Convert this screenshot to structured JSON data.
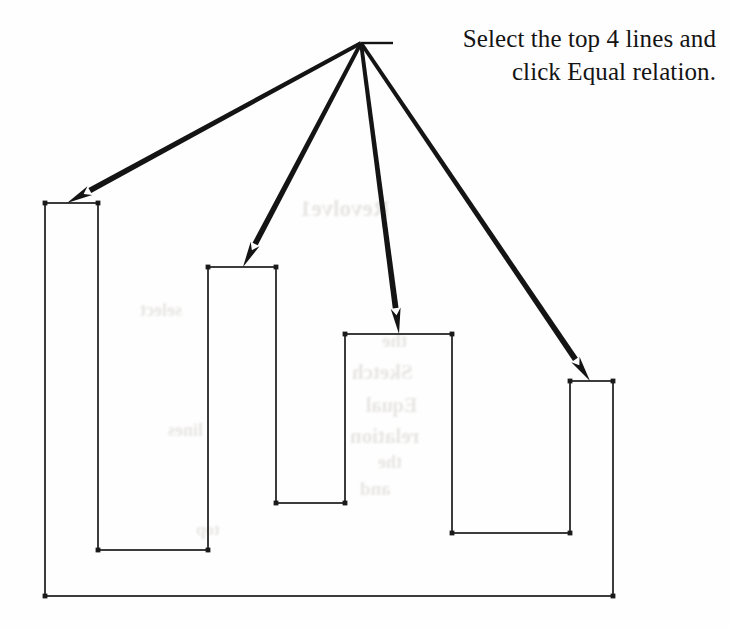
{
  "annotation": {
    "line1": "Select the top 4 lines and",
    "line2": "click Equal relation.",
    "arrow_count": 4,
    "leader_origin": {
      "x": 361,
      "y": 43
    },
    "leader_tail_x": 393,
    "ink_color": "#141414"
  },
  "sketch": {
    "name": "castellated-profile",
    "stroke_color": "#3c3c3c",
    "stroke_width": 2.0,
    "endpoint_color": "#1a1a1a",
    "baseline_y": 596,
    "left_x": 45,
    "right_x": 613,
    "towers": [
      {
        "id": "tower-1",
        "left": 45,
        "right": 98,
        "top": 203,
        "arrow_tip_x": 67,
        "arrow_tip_y": 203
      },
      {
        "id": "tower-2",
        "left": 208,
        "right": 276,
        "top": 267,
        "arrow_tip_x": 243,
        "arrow_tip_y": 267
      },
      {
        "id": "tower-3",
        "left": 345,
        "right": 452,
        "top": 334,
        "arrow_tip_x": 399,
        "arrow_tip_y": 334
      },
      {
        "id": "tower-4",
        "left": 570,
        "right": 613,
        "top": 381,
        "arrow_tip_x": 590,
        "arrow_tip_y": 381
      }
    ],
    "notches": [
      {
        "id": "notch-1",
        "left": 98,
        "right": 208,
        "bottom": 550
      },
      {
        "id": "notch-2",
        "left": 276,
        "right": 345,
        "bottom": 503
      },
      {
        "id": "notch-3",
        "left": 452,
        "right": 570,
        "bottom": 533
      }
    ],
    "outline_path": "M 45 596 L 45 203 L 98 203 L 98 550 L 208 550 L 208 267 L 276 267 L 276 503 L 345 503 L 345 334 L 452 334 L 452 533 L 570 533 L 570 381 L 613 381 L 613 596 Z",
    "endpoints": [
      {
        "x": 45,
        "y": 203
      },
      {
        "x": 98,
        "y": 203
      },
      {
        "x": 98,
        "y": 550
      },
      {
        "x": 208,
        "y": 550
      },
      {
        "x": 208,
        "y": 267
      },
      {
        "x": 276,
        "y": 267
      },
      {
        "x": 276,
        "y": 503
      },
      {
        "x": 345,
        "y": 503
      },
      {
        "x": 345,
        "y": 334
      },
      {
        "x": 452,
        "y": 334
      },
      {
        "x": 452,
        "y": 533
      },
      {
        "x": 570,
        "y": 533
      },
      {
        "x": 570,
        "y": 381
      },
      {
        "x": 613,
        "y": 381
      },
      {
        "x": 613,
        "y": 596
      },
      {
        "x": 45,
        "y": 596
      }
    ]
  },
  "showthrough": [
    {
      "text": "Revolve1",
      "x": 300,
      "y": 196,
      "size": 23
    },
    {
      "text": "the",
      "x": 382,
      "y": 330,
      "size": 19
    },
    {
      "text": "Sketch",
      "x": 352,
      "y": 360,
      "size": 21
    },
    {
      "text": "Equal",
      "x": 366,
      "y": 394,
      "size": 20
    },
    {
      "text": "relation",
      "x": 350,
      "y": 424,
      "size": 21
    },
    {
      "text": "the",
      "x": 378,
      "y": 452,
      "size": 18
    },
    {
      "text": "and",
      "x": 360,
      "y": 478,
      "size": 19
    },
    {
      "text": "select",
      "x": 140,
      "y": 300,
      "size": 18
    },
    {
      "text": "lines",
      "x": 168,
      "y": 420,
      "size": 18
    },
    {
      "text": "top",
      "x": 196,
      "y": 520,
      "size": 17
    }
  ]
}
